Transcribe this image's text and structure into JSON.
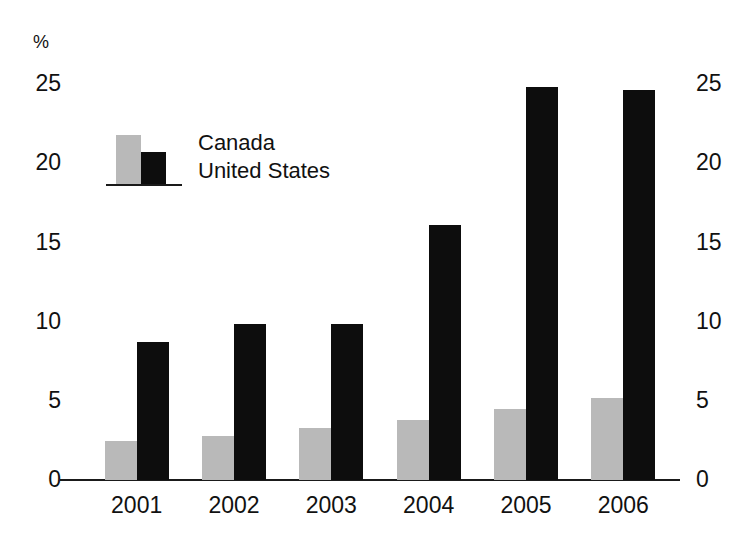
{
  "chart_data": {
    "type": "bar",
    "title": "",
    "subtitle": "",
    "xlabel": "",
    "ylabel": "%",
    "unit_label": "%",
    "categories": [
      "2001",
      "2002",
      "2003",
      "2004",
      "2005",
      "2006"
    ],
    "series": [
      {
        "name": "Canada",
        "color": "#b9b9b9",
        "values": [
          2.3,
          2.6,
          3.1,
          3.6,
          4.2,
          4.9
        ]
      },
      {
        "name": "United States",
        "color": "#0d0d0d",
        "values": [
          8.2,
          9.3,
          9.3,
          15.2,
          23.4,
          23.2
        ]
      }
    ],
    "ylim": [
      0,
      25
    ],
    "yticks": [
      0,
      5,
      10,
      15,
      20,
      25
    ],
    "ytick_labels": [
      "0",
      "5",
      "10",
      "15",
      "20",
      "25"
    ],
    "right_axis": {
      "enabled": true,
      "yticks": [
        0,
        5,
        10,
        15,
        20,
        25
      ],
      "ytick_labels": [
        "0",
        "5",
        "10",
        "15",
        "20",
        "25"
      ]
    },
    "grid": false,
    "legend": {
      "position": "upper-left-inside",
      "entries": [
        {
          "label": "Canada",
          "color": "#b9b9b9"
        },
        {
          "label": "United States",
          "color": "#0d0d0d"
        }
      ]
    },
    "annotations": []
  }
}
